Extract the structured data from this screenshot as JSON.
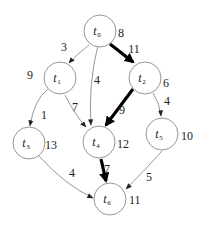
{
  "diagram": {
    "type": "directed-acyclic-task-graph",
    "nodes": [
      {
        "id": "t0",
        "base": "t",
        "sub": "0",
        "weight": "8",
        "x": 100,
        "y": 31,
        "wx": 118,
        "wy": 37
      },
      {
        "id": "t1",
        "base": "t",
        "sub": "1",
        "weight": "9",
        "x": 60,
        "y": 78,
        "wx": 27,
        "wy": 79
      },
      {
        "id": "t2",
        "base": "t",
        "sub": "2",
        "weight": "6",
        "x": 145,
        "y": 78,
        "wx": 163,
        "wy": 87
      },
      {
        "id": "t3",
        "base": "t",
        "sub": "3",
        "weight": "13",
        "x": 29,
        "y": 143,
        "wx": 45,
        "wy": 149
      },
      {
        "id": "t4",
        "base": "t",
        "sub": "4",
        "weight": "12",
        "x": 99,
        "y": 142,
        "wx": 117,
        "wy": 148
      },
      {
        "id": "t5",
        "base": "t",
        "sub": "5",
        "weight": "10",
        "x": 162,
        "y": 134,
        "wx": 181,
        "wy": 140
      },
      {
        "id": "t6",
        "base": "t",
        "sub": "6",
        "weight": "11",
        "x": 110,
        "y": 199,
        "wx": 129,
        "wy": 204
      }
    ],
    "edges": [
      {
        "from": "t0",
        "to": "t1",
        "weight": "3",
        "critical": false,
        "path": "M89,45 Q76,55 69,63",
        "lx": 64,
        "ly": 51
      },
      {
        "from": "t0",
        "to": "t4",
        "weight": "4",
        "critical": false,
        "path": "M98,45 Q88,85 91,125",
        "lx": 97,
        "ly": 84
      },
      {
        "from": "t0",
        "to": "t2",
        "weight": "11",
        "critical": true,
        "path": "M110,44 L133,62",
        "lx": 134,
        "ly": 53
      },
      {
        "from": "t1",
        "to": "t3",
        "weight": "1",
        "critical": false,
        "path": "M48,89 Q34,100 30,126",
        "lx": 44,
        "ly": 119
      },
      {
        "from": "t1",
        "to": "t4",
        "weight": "7",
        "critical": false,
        "path": "M65,95 Q75,115 86,127",
        "lx": 75,
        "ly": 111
      },
      {
        "from": "t2",
        "to": "t4",
        "weight": "9",
        "critical": true,
        "path": "M133,89 L106,125",
        "lx": 122,
        "ly": 114
      },
      {
        "from": "t2",
        "to": "t5",
        "weight": "4",
        "critical": false,
        "path": "M153,93 Q160,104 161,116",
        "lx": 167,
        "ly": 105
      },
      {
        "from": "t3",
        "to": "t6",
        "weight": "4",
        "critical": false,
        "path": "M39,156 Q65,185 93,198",
        "lx": 72,
        "ly": 177
      },
      {
        "from": "t4",
        "to": "t6",
        "weight": "7",
        "critical": true,
        "path": "M101,159 L106,181",
        "lx": 107,
        "ly": 173
      },
      {
        "from": "t5",
        "to": "t6",
        "weight": "5",
        "critical": false,
        "path": "M162,151 Q145,170 126,189",
        "lx": 149,
        "ly": 181
      }
    ],
    "colors": {
      "node_stroke": "#8a8a8a",
      "edge_normal": "#8a8a8a",
      "edge_critical": "#000000",
      "text": "#222222",
      "background": "#ffffff"
    },
    "node_radius": 16
  }
}
